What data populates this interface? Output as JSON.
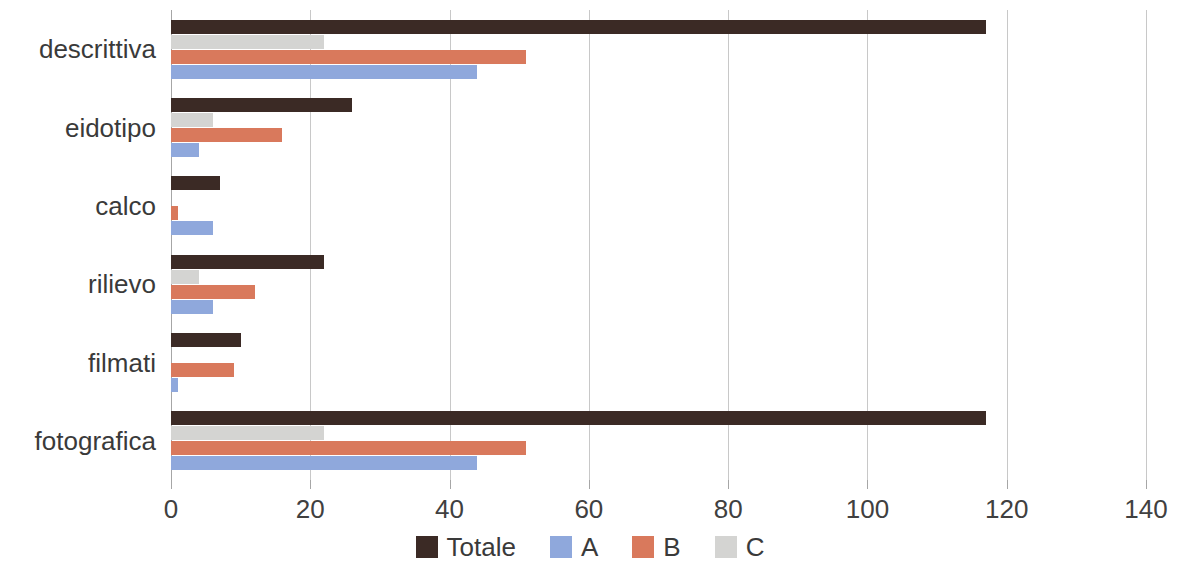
{
  "chart_data": {
    "type": "bar",
    "orientation": "horizontal",
    "title": "",
    "xlabel": "",
    "ylabel": "",
    "xlim": [
      0,
      140
    ],
    "xticks": [
      0,
      20,
      40,
      60,
      80,
      100,
      120,
      140
    ],
    "xtick_labels": [
      "0",
      "20",
      "40",
      "60",
      "80",
      "100",
      "120",
      "140"
    ],
    "grid": true,
    "legend_position": "bottom",
    "categories": [
      "descrittiva",
      "eidotipo",
      "calco",
      "rilievo",
      "filmati",
      "fotografica"
    ],
    "series": [
      {
        "name": "Totale",
        "color": "#3b2a25",
        "values": [
          117,
          26,
          7,
          22,
          10,
          117
        ]
      },
      {
        "name": "A",
        "color": "#8fa8dc",
        "values": [
          44,
          4,
          6,
          6,
          1,
          44
        ]
      },
      {
        "name": "B",
        "color": "#d9795c",
        "values": [
          51,
          16,
          1,
          12,
          9,
          51
        ]
      },
      {
        "name": "C",
        "color": "#d4d4d2",
        "values": [
          22,
          6,
          0,
          4,
          0,
          22
        ]
      }
    ],
    "series_draw_order": [
      "Totale",
      "C",
      "B",
      "A"
    ],
    "legend_entries": [
      {
        "label": "Totale",
        "color": "#3b2a25"
      },
      {
        "label": "A",
        "color": "#8fa8dc"
      },
      {
        "label": "B",
        "color": "#d9795c"
      },
      {
        "label": "C",
        "color": "#d4d4d2"
      }
    ]
  },
  "colors": {
    "background": "#ffffff",
    "axis": "#a6a6a6",
    "gridline": "#c8c8c8",
    "text": "#3a3a3a",
    "totale": "#3b2a25",
    "a": "#8fa8dc",
    "b": "#d9795c",
    "c": "#d4d4d2"
  }
}
